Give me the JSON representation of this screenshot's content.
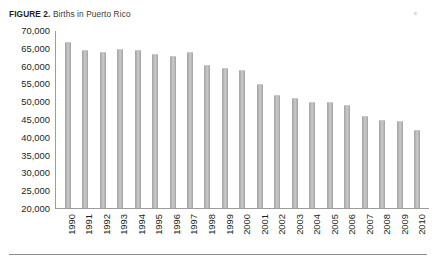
{
  "figure": {
    "label": "FIGURE 2.",
    "title": "Births in Puerto Rico"
  },
  "chart_data": {
    "type": "bar",
    "title": "Births in Puerto Rico",
    "xlabel": "",
    "ylabel": "",
    "ylim": [
      20000,
      70000
    ],
    "yticks": [
      70000,
      65000,
      60000,
      55000,
      50000,
      45000,
      40000,
      35000,
      30000,
      25000,
      20000
    ],
    "ytick_labels": [
      "70,000",
      "65,000",
      "60,000",
      "55,000",
      "50,000",
      "45,000",
      "40,000",
      "35,000",
      "30,000",
      "25,000",
      "20,000"
    ],
    "grid": false,
    "legend": null,
    "bar_color": "#bdbdbd",
    "axis_color": "#9d9d9d",
    "categories": [
      "1990",
      "1991",
      "1992",
      "1993",
      "1994",
      "1995",
      "1996",
      "1997",
      "1998",
      "1999",
      "2000",
      "2001",
      "2002",
      "2003",
      "2004",
      "2005",
      "2006",
      "2007",
      "2008",
      "2009",
      "2010"
    ],
    "values": [
      67000,
      64500,
      64000,
      65000,
      64500,
      63500,
      63000,
      64000,
      60500,
      59500,
      59000,
      55000,
      52000,
      51000,
      50000,
      50000,
      49000,
      46000,
      45000,
      44500,
      42000
    ]
  }
}
